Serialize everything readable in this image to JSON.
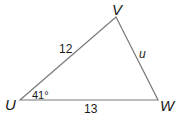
{
  "diagram": {
    "type": "triangle",
    "vertices": [
      {
        "name": "U",
        "x": 20,
        "y": 100
      },
      {
        "name": "V",
        "x": 116,
        "y": 17
      },
      {
        "name": "W",
        "x": 158,
        "y": 100
      }
    ],
    "sides": {
      "UV": "12",
      "UW": "13",
      "VW": "u"
    },
    "angles": {
      "U": "41°"
    },
    "stroke_color": "#7a7a7a",
    "text_color": "#1a1a1a"
  }
}
